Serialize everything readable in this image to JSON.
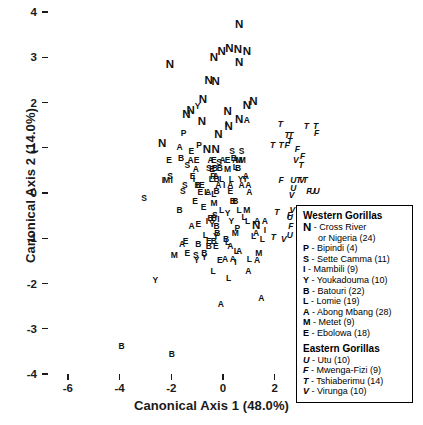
{
  "chart_data": {
    "type": "scatter",
    "title": "",
    "xlabel": "Canonical Axis 1 (48.0%)",
    "ylabel": "Canonical Axis 2 (14.0%)",
    "xlim": [
      -7,
      7
    ],
    "ylim": [
      -4,
      4
    ],
    "xticks": [
      -6,
      -4,
      -2,
      0,
      2,
      4,
      6
    ],
    "yticks": [
      -4,
      -3,
      -2,
      -1,
      0,
      1,
      2,
      3,
      4
    ],
    "grid": false,
    "legend_position": "right-lower",
    "marker_style": "text-labels",
    "series": [
      {
        "name": "Cross River or Nigeria",
        "code": "N",
        "group": "Western Gorillas",
        "n": 24,
        "italic": false,
        "large": true,
        "points": [
          [
            0.62,
            3.72
          ],
          [
            -0.05,
            3.12
          ],
          [
            0.25,
            3.18
          ],
          [
            0.58,
            3.16
          ],
          [
            0.92,
            3.12
          ],
          [
            -0.35,
            2.98
          ],
          [
            0.62,
            2.88
          ],
          [
            -2.05,
            2.82
          ],
          [
            -0.55,
            2.48
          ],
          [
            -0.28,
            2.45
          ],
          [
            -0.78,
            2.05
          ],
          [
            -1.25,
            1.82
          ],
          [
            -1.42,
            1.72
          ],
          [
            -0.82,
            1.58
          ],
          [
            0.18,
            1.78
          ],
          [
            0.92,
            1.92
          ],
          [
            1.18,
            2.02
          ],
          [
            0.62,
            1.62
          ],
          [
            -0.18,
            1.28
          ],
          [
            -2.35,
            1.08
          ],
          [
            -0.62,
            0.95
          ],
          [
            -0.28,
            0.95
          ],
          [
            1.28,
            -0.72
          ],
          [
            0.22,
            1.45
          ]
        ]
      },
      {
        "name": "Bipindi",
        "code": "P",
        "group": "Western Gorillas",
        "n": 4,
        "italic": false,
        "points": [
          [
            -1.52,
            1.32
          ],
          [
            -0.92,
            1.05
          ],
          [
            0.55,
            -0.78
          ],
          [
            -0.38,
            0.38
          ]
        ]
      },
      {
        "name": "Sette Camma",
        "code": "S",
        "group": "Western Gorillas",
        "n": 11,
        "italic": false,
        "points": [
          [
            0.35,
            0.92
          ],
          [
            0.72,
            0.92
          ],
          [
            -1.38,
            0.62
          ],
          [
            -2.05,
            0.38
          ],
          [
            -1.48,
            0.18
          ],
          [
            -1.55,
            0.05
          ],
          [
            -3.05,
            -0.12
          ],
          [
            -0.55,
            0.55
          ],
          [
            -0.32,
            -0.48
          ],
          [
            -1.05,
            -1.38
          ],
          [
            -0.15,
            0.68
          ]
        ]
      },
      {
        "name": "Mambili",
        "code": "I",
        "group": "Western Gorillas",
        "n": 9,
        "italic": false,
        "points": [
          [
            0.12,
            1.52
          ],
          [
            -2.32,
            0.28
          ],
          [
            -1.98,
            0.28
          ],
          [
            -0.18,
            -0.58
          ],
          [
            1.62,
            -0.82
          ],
          [
            0.48,
            -1.52
          ],
          [
            -1.12,
            0.32
          ],
          [
            0.05,
            0.18
          ],
          [
            -0.62,
            -0.62
          ]
        ]
      },
      {
        "name": "Youkadouma",
        "code": "Y",
        "group": "Western Gorillas",
        "n": 10,
        "italic": false,
        "points": [
          [
            -0.98,
            1.92
          ],
          [
            0.68,
            0.32
          ],
          [
            -0.42,
            -0.68
          ],
          [
            -1.02,
            -1.48
          ],
          [
            -2.62,
            -1.92
          ],
          [
            0.32,
            -0.62
          ],
          [
            0.18,
            -0.45
          ],
          [
            0.85,
            0.32
          ],
          [
            -0.72,
            -1.42
          ],
          [
            -0.28,
            -0.95
          ]
        ]
      },
      {
        "name": "Batouri",
        "code": "B",
        "group": "Western Gorillas",
        "n": 22,
        "italic": false,
        "points": [
          [
            -1.62,
            0.78
          ],
          [
            0.42,
            0.78
          ],
          [
            -0.12,
            0.55
          ],
          [
            -0.32,
            0.55
          ],
          [
            0.58,
            0.55
          ],
          [
            -0.25,
            0.32
          ],
          [
            -0.98,
            0.18
          ],
          [
            -0.25,
            0.05
          ],
          [
            0.38,
            -0.18
          ],
          [
            0.48,
            -0.18
          ],
          [
            -1.68,
            -0.38
          ],
          [
            -0.48,
            -0.55
          ],
          [
            -0.35,
            -0.55
          ],
          [
            -0.25,
            -0.72
          ],
          [
            -0.22,
            -0.88
          ],
          [
            -0.55,
            -1.18
          ],
          [
            0.12,
            -1.02
          ],
          [
            -0.95,
            -1.12
          ],
          [
            -0.72,
            -1.32
          ],
          [
            -0.35,
            -1.05
          ],
          [
            -3.92,
            -3.38
          ],
          [
            -1.98,
            -3.55
          ]
        ]
      },
      {
        "name": "Lomie",
        "code": "L",
        "group": "Western Gorillas",
        "n": 19,
        "italic": false,
        "points": [
          [
            0.48,
            0.58
          ],
          [
            -0.45,
            0.32
          ],
          [
            -0.05,
            0.32
          ],
          [
            0.32,
            0.32
          ],
          [
            -0.95,
            0.18
          ],
          [
            -0.62,
            0.02
          ],
          [
            -0.35,
            -0.02
          ],
          [
            0.62,
            -0.38
          ],
          [
            0.82,
            -0.52
          ],
          [
            -0.68,
            -0.92
          ],
          [
            0.18,
            -1.08
          ],
          [
            1.18,
            -0.95
          ],
          [
            0.52,
            -1.28
          ],
          [
            1.02,
            -1.45
          ],
          [
            -0.38,
            -1.72
          ],
          [
            0.22,
            -1.88
          ],
          [
            1.52,
            -1.02
          ],
          [
            -0.05,
            -0.38
          ],
          [
            0.95,
            -0.62
          ]
        ]
      },
      {
        "name": "Abong Mbang",
        "code": "A",
        "group": "Western Gorillas",
        "n": 28,
        "italic": false,
        "points": [
          [
            0.92,
            1.62
          ],
          [
            -1.68,
            1.02
          ],
          [
            -1.25,
            0.72
          ],
          [
            -0.48,
            0.72
          ],
          [
            -0.02,
            0.72
          ],
          [
            0.48,
            0.72
          ],
          [
            -1.05,
            0.52
          ],
          [
            -0.28,
            0.38
          ],
          [
            0.88,
            0.38
          ],
          [
            -0.18,
            0.18
          ],
          [
            0.28,
            0.18
          ],
          [
            0.72,
            0.18
          ],
          [
            0.98,
            0.18
          ],
          [
            -0.58,
            0.02
          ],
          [
            1.02,
            0.02
          ],
          [
            -1.22,
            -0.72
          ],
          [
            1.32,
            -0.62
          ],
          [
            1.62,
            -0.62
          ],
          [
            1.28,
            -0.88
          ],
          [
            -1.58,
            -1.12
          ],
          [
            0.28,
            -1.18
          ],
          [
            0.62,
            -1.28
          ],
          [
            0.08,
            -1.45
          ],
          [
            0.38,
            -1.45
          ],
          [
            1.32,
            -1.48
          ],
          [
            0.98,
            -1.72
          ],
          [
            1.48,
            -2.32
          ],
          [
            -0.08,
            -2.45
          ]
        ]
      },
      {
        "name": "Metet",
        "code": "M",
        "group": "Western Gorillas",
        "n": 9,
        "italic": false,
        "points": [
          [
            -2.18,
            0.28
          ],
          [
            0.62,
            0.72
          ],
          [
            0.75,
            0.72
          ],
          [
            0.48,
            -0.88
          ],
          [
            -1.88,
            -1.38
          ],
          [
            1.38,
            -1.32
          ],
          [
            0.18,
            0.52
          ],
          [
            -0.35,
            -0.22
          ],
          [
            0.92,
            -0.38
          ]
        ]
      },
      {
        "name": "Ebolowa",
        "code": "E",
        "group": "Western Gorillas",
        "n": 18,
        "italic": false,
        "points": [
          [
            -1.22,
            0.92
          ],
          [
            -2.08,
            0.72
          ],
          [
            -1.02,
            0.72
          ],
          [
            -0.35,
            0.72
          ],
          [
            0.18,
            0.72
          ],
          [
            -0.42,
            0.52
          ],
          [
            -1.18,
            0.38
          ],
          [
            -0.82,
            0.18
          ],
          [
            -0.88,
            0.02
          ],
          [
            0.28,
            0.05
          ],
          [
            -1.08,
            -0.18
          ],
          [
            -0.75,
            -0.32
          ],
          [
            -0.55,
            -1.05
          ],
          [
            -0.95,
            -0.68
          ],
          [
            -1.38,
            -1.32
          ],
          [
            -0.28,
            -1.18
          ],
          [
            -0.12,
            -1.48
          ],
          [
            -1.45,
            -1.05
          ]
        ]
      },
      {
        "name": "Utu",
        "code": "U",
        "group": "Eastern Gorillas",
        "n": 10,
        "italic": true,
        "points": [
          [
            2.72,
            0.28
          ],
          [
            2.72,
            0.12
          ],
          [
            3.45,
            0.05
          ],
          [
            3.62,
            0.05
          ],
          [
            2.58,
            -0.52
          ],
          [
            2.58,
            -0.92
          ],
          [
            3.88,
            -0.62
          ],
          [
            4.28,
            -0.78
          ],
          [
            4.18,
            -1.28
          ],
          [
            3.52,
            -1.92
          ]
        ]
      },
      {
        "name": "Mwenga-Fizi",
        "code": "F",
        "group": "Eastern Gorillas",
        "n": 9,
        "italic": true,
        "points": [
          [
            3.62,
            1.32
          ],
          [
            2.48,
            1.05
          ],
          [
            2.88,
            0.98
          ],
          [
            3.08,
            0.82
          ],
          [
            2.25,
            0.28
          ],
          [
            3.32,
            0.05
          ],
          [
            2.58,
            -0.48
          ],
          [
            3.72,
            -0.92
          ],
          [
            2.62,
            -0.72
          ]
        ]
      },
      {
        "name": "Tshiaberimu",
        "code": "T",
        "group": "Eastern Gorillas",
        "n": 14,
        "italic": true,
        "points": [
          [
            2.22,
            1.52
          ],
          [
            3.22,
            1.48
          ],
          [
            3.58,
            1.48
          ],
          [
            2.48,
            1.28
          ],
          [
            2.62,
            1.28
          ],
          [
            2.58,
            1.15
          ],
          [
            1.92,
            1.05
          ],
          [
            2.25,
            1.05
          ],
          [
            3.02,
            0.62
          ],
          [
            3.18,
            0.28
          ],
          [
            2.92,
            0.28
          ],
          [
            2.08,
            -0.42
          ],
          [
            2.95,
            -0.48
          ],
          [
            1.95,
            -0.98
          ]
        ]
      },
      {
        "name": "Virunga",
        "code": "V",
        "group": "Eastern Gorillas",
        "n": 10,
        "italic": true,
        "points": [
          [
            2.82,
            0.72
          ],
          [
            3.05,
            0.28
          ],
          [
            2.68,
            -0.38
          ],
          [
            3.02,
            -0.38
          ],
          [
            3.42,
            -0.52
          ],
          [
            2.98,
            -0.82
          ],
          [
            3.02,
            -0.95
          ],
          [
            2.65,
            -0.05
          ],
          [
            2.35,
            -1.02
          ],
          [
            3.28,
            -0.72
          ]
        ]
      }
    ]
  },
  "legend": {
    "western_title": "Western Gorillas",
    "eastern_title": "Eastern Gorillas",
    "western_entries": [
      {
        "sym": "N",
        "text": "- Cross River",
        "cont": "or Nigeria (24)",
        "large": true
      },
      {
        "sym": "P",
        "text": "- Bipindi (4)",
        "cont": "",
        "large": false
      },
      {
        "sym": "S",
        "text": "- Sette Camma (11)",
        "cont": "",
        "large": false
      },
      {
        "sym": "I",
        "text": "- Mambili (9)",
        "cont": "",
        "large": false
      },
      {
        "sym": "Y",
        "text": "- Youkadouma (10)",
        "cont": "",
        "large": false
      },
      {
        "sym": "B",
        "text": "- Batouri (22)",
        "cont": "",
        "large": false
      },
      {
        "sym": "L",
        "text": "- Lomie (19)",
        "cont": "",
        "large": false
      },
      {
        "sym": "A",
        "text": "- Abong Mbang (28)",
        "cont": "",
        "large": false
      },
      {
        "sym": "M",
        "text": "- Metet (9)",
        "cont": "",
        "large": false
      },
      {
        "sym": "E",
        "text": "- Ebolowa (18)",
        "cont": "",
        "large": false
      }
    ],
    "eastern_entries": [
      {
        "sym": "U",
        "text": "- Utu (10)"
      },
      {
        "sym": "F",
        "text": "- Mwenga-Fizi (9)"
      },
      {
        "sym": "T",
        "text": "- Tshiaberimu (14)"
      },
      {
        "sym": "V",
        "text": "- Virunga (10)"
      }
    ]
  }
}
